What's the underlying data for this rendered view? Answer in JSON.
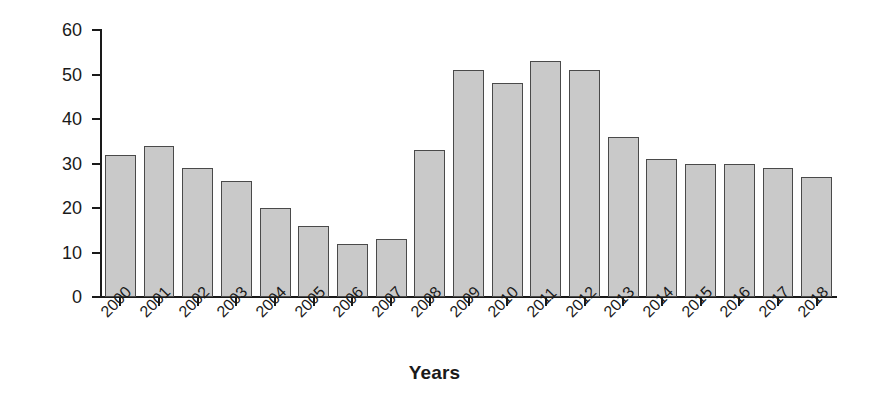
{
  "chart_data": {
    "type": "bar",
    "title": "",
    "subtitle": "",
    "xlabel": "Years",
    "ylabel": "Percentage",
    "categories": [
      "2000",
      "2001",
      "2002",
      "2003",
      "2004",
      "2005",
      "2006",
      "2007",
      "2008",
      "2009",
      "2010",
      "2011",
      "2012",
      "2013",
      "2014",
      "2015",
      "2016",
      "2017",
      "2018"
    ],
    "values": [
      32,
      34,
      29,
      26,
      20,
      16,
      12,
      13,
      33,
      51,
      48,
      53,
      51,
      36,
      31,
      30,
      30,
      29,
      27
    ],
    "ylim": [
      0,
      60
    ],
    "y_ticks": [
      0,
      10,
      20,
      30,
      40,
      50,
      60
    ],
    "y_tick_labels": [
      "0",
      "10",
      "20",
      "30",
      "40",
      "50",
      "60"
    ],
    "grid": false,
    "legend": null,
    "legend_position": "none",
    "annotations": [],
    "bar_fill_color": "#c9c9c9",
    "bar_edge_color": "#4a4a4a",
    "axis_color": "#1a1a1a",
    "background_color": "#ffffff",
    "x_tick_label_rotation": -45
  }
}
